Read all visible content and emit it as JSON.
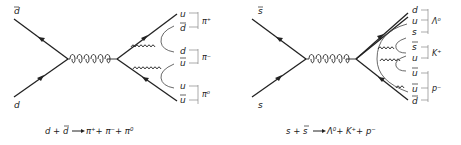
{
  "diagrams": [
    {
      "name": "pion-production",
      "incoming": [
        {
          "label": "d",
          "bar": true
        },
        {
          "label": "d",
          "bar": false
        }
      ],
      "outgoing_quarks": [
        {
          "label": "u",
          "bar": false
        },
        {
          "label": "d",
          "bar": true
        },
        {
          "label": "d",
          "bar": false
        },
        {
          "label": "u",
          "bar": true
        },
        {
          "label": "u",
          "bar": false
        },
        {
          "label": "u",
          "bar": true
        }
      ],
      "hadrons": [
        {
          "label": "π⁺"
        },
        {
          "label": "π⁻"
        },
        {
          "label": "π⁰"
        }
      ],
      "equation": "d + d̄ ⟶ π⁺ + π⁻ + π⁰"
    },
    {
      "name": "strange-baryon-production",
      "incoming": [
        {
          "label": "s",
          "bar": true
        },
        {
          "label": "s",
          "bar": false
        }
      ],
      "outgoing_quarks": [
        {
          "label": "d",
          "bar": false
        },
        {
          "label": "u",
          "bar": false
        },
        {
          "label": "s",
          "bar": false
        },
        {
          "label": "s",
          "bar": true
        },
        {
          "label": "u",
          "bar": false
        },
        {
          "label": "u",
          "bar": true
        },
        {
          "label": "u",
          "bar": true
        },
        {
          "label": "d",
          "bar": true
        }
      ],
      "hadrons": [
        {
          "label": "Λ⁰"
        },
        {
          "label": "K⁺"
        },
        {
          "label": "p⁻"
        }
      ],
      "equation": "s + s̄ ⟶ Λ⁰ + K⁺ + p⁻"
    }
  ],
  "texts": {
    "d1_in_top": "d",
    "d1_in_bot": "d",
    "d1_q": [
      "u",
      "d",
      "d",
      "u",
      "u",
      "u"
    ],
    "d1_h": [
      "π⁺",
      "π⁻",
      "π⁰"
    ],
    "d1_eq_a": "d + ",
    "d1_eq_b": "d",
    "d1_eq_c": " π⁺+ π⁻+ π⁰",
    "d2_in_top": "s",
    "d2_in_bot": "s",
    "d2_q": [
      "d",
      "u",
      "s",
      "s",
      "u",
      "u",
      "u",
      "d"
    ],
    "d2_h": [
      "Λ⁰",
      "K⁺",
      "p⁻"
    ],
    "d2_eq_a": "s + ",
    "d2_eq_b": "s",
    "d2_eq_c": " Λ⁰+ K⁺+ p⁻"
  }
}
